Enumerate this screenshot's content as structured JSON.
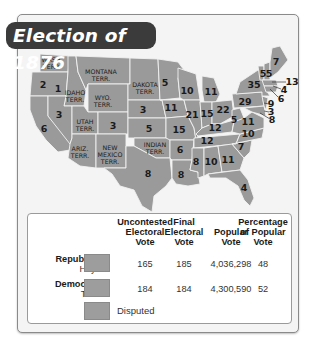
{
  "title": "Election of 1876",
  "map": {
    "territory_labels": [
      {
        "id": "wash",
        "line1": "WASH.",
        "line2": "TERR.",
        "x": 52,
        "y": 63
      },
      {
        "id": "montana",
        "line1": "MONTANA",
        "line2": "TERR.",
        "x": 101,
        "y": 75
      },
      {
        "id": "idaho",
        "line1": "IDAHO",
        "line2": "TERR.",
        "x": 75,
        "y": 96
      },
      {
        "id": "wyo",
        "line1": "WYO.",
        "line2": "TERR.",
        "x": 103,
        "y": 101
      },
      {
        "id": "dakota",
        "line1": "DAKOTA",
        "line2": "TERR.",
        "x": 145,
        "y": 88
      },
      {
        "id": "utah",
        "line1": "UTAH",
        "line2": "TERR.",
        "x": 85,
        "y": 125
      },
      {
        "id": "ariz",
        "line1": "ARIZ.",
        "line2": "TERR.",
        "x": 80,
        "y": 152
      },
      {
        "id": "newmexico",
        "line1": "NEW",
        "line2": "MEXICO",
        "line3": "TERR.",
        "x": 110,
        "y": 154
      },
      {
        "id": "indian",
        "line1": "INDIAN",
        "line2": "TERR.",
        "x": 155,
        "y": 148
      }
    ],
    "electoral_votes": [
      {
        "state": "Oregon",
        "votes": "2",
        "x": 43,
        "y": 85
      },
      {
        "state": "Idaho-area",
        "votes": "1",
        "x": 58,
        "y": 89
      },
      {
        "state": "Nevada",
        "votes": "3",
        "x": 59,
        "y": 115
      },
      {
        "state": "California",
        "votes": "6",
        "x": 44,
        "y": 129
      },
      {
        "state": "Colorado",
        "votes": "3",
        "x": 113,
        "y": 126
      },
      {
        "state": "Nebraska",
        "votes": "3",
        "x": 143,
        "y": 110
      },
      {
        "state": "Kansas",
        "votes": "5",
        "x": 149,
        "y": 129
      },
      {
        "state": "Texas",
        "votes": "8",
        "x": 148,
        "y": 174
      },
      {
        "state": "Minnesota",
        "votes": "5",
        "x": 165,
        "y": 83
      },
      {
        "state": "Iowa",
        "votes": "11",
        "x": 171,
        "y": 108
      },
      {
        "state": "Missouri",
        "votes": "15",
        "x": 179,
        "y": 130
      },
      {
        "state": "Arkansas",
        "votes": "6",
        "x": 180,
        "y": 150
      },
      {
        "state": "Louisiana",
        "votes": "8",
        "x": 181,
        "y": 175
      },
      {
        "state": "Wisconsin",
        "votes": "10",
        "x": 187,
        "y": 91
      },
      {
        "state": "Illinois",
        "votes": "21",
        "x": 192,
        "y": 115
      },
      {
        "state": "Michigan",
        "votes": "11",
        "x": 211,
        "y": 92
      },
      {
        "state": "Indiana",
        "votes": "15",
        "x": 207,
        "y": 114
      },
      {
        "state": "Ohio",
        "votes": "22",
        "x": 223,
        "y": 110
      },
      {
        "state": "Kentucky",
        "votes": "12",
        "x": 215,
        "y": 128
      },
      {
        "state": "Tennessee",
        "votes": "12",
        "x": 207,
        "y": 141
      },
      {
        "state": "Mississippi",
        "votes": "8",
        "x": 196,
        "y": 162
      },
      {
        "state": "Alabama",
        "votes": "10",
        "x": 211,
        "y": 162
      },
      {
        "state": "Georgia",
        "votes": "11",
        "x": 228,
        "y": 160
      },
      {
        "state": "Florida",
        "votes": "4",
        "x": 244,
        "y": 188
      },
      {
        "state": "South Carolina",
        "votes": "7",
        "x": 241,
        "y": 147
      },
      {
        "state": "North Carolina",
        "votes": "10",
        "x": 248,
        "y": 134
      },
      {
        "state": "West Virginia",
        "votes": "5",
        "x": 234,
        "y": 120
      },
      {
        "state": "Virginia",
        "votes": "11",
        "x": 248,
        "y": 122
      },
      {
        "state": "Pennsylvania",
        "votes": "29",
        "x": 245,
        "y": 102
      },
      {
        "state": "New York",
        "votes": "35",
        "x": 254,
        "y": 85
      },
      {
        "state": "Vermont",
        "votes": "5",
        "x": 263,
        "y": 74
      },
      {
        "state": "New Hampshire",
        "votes": "5",
        "x": 269,
        "y": 74
      },
      {
        "state": "Maine",
        "votes": "7",
        "x": 276,
        "y": 62
      },
      {
        "state": "Massachusetts",
        "votes": "13",
        "x": 290,
        "y": 82
      },
      {
        "state": "Rhode Island",
        "votes": "4",
        "x": 283,
        "y": 89
      },
      {
        "state": "Connecticut",
        "votes": "6",
        "x": 281,
        "y": 98
      },
      {
        "state": "New Jersey",
        "votes": "9",
        "x": 271,
        "y": 104
      },
      {
        "state": "Delaware",
        "votes": "3",
        "x": 271,
        "y": 113
      },
      {
        "state": "Maryland",
        "votes": "8",
        "x": 272,
        "y": 121
      }
    ]
  },
  "legend": {
    "headers": {
      "uncontested": [
        "Uncontested",
        "Electoral",
        "Vote"
      ],
      "final": [
        "Final",
        "Electoral",
        "Vote"
      ],
      "popular": [
        "Popular",
        "Vote"
      ],
      "percentage": [
        "Percentage",
        "of Popular",
        "Vote"
      ]
    },
    "rows": [
      {
        "party": "Republican",
        "candidate": "Hayes",
        "swatch_color": "#9d9d9d",
        "uncontested": "165",
        "final": "185",
        "popular": "4,036,298",
        "percentage": "48"
      },
      {
        "party": "Democratic",
        "candidate": "Tilden",
        "swatch_color": "#9d9d9d",
        "uncontested": "184",
        "final": "184",
        "popular": "4,300,590",
        "percentage": "52"
      }
    ],
    "disputed": {
      "label": "Disputed",
      "swatch_color": "#9d9d9d"
    }
  },
  "colors": {
    "land": "#9a9a9a",
    "border": "#f2f2f2",
    "title_bg": "#3b3b3b",
    "background": "#f4f4f4"
  }
}
